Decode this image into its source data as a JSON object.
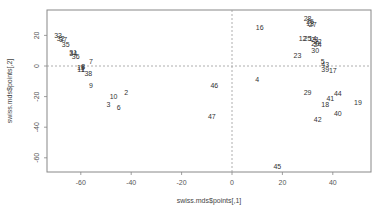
{
  "chart_data": {
    "type": "scatter",
    "title": "",
    "xlabel": "swiss.mds$points[,1]",
    "ylabel": "swiss.mds$points[,2]",
    "xlim": [
      -73,
      55
    ],
    "ylim": [
      -70,
      36
    ],
    "x_ticks": [
      -60,
      -40,
      -20,
      0,
      20,
      40
    ],
    "y_ticks": [
      20,
      0,
      -20,
      -40,
      -60
    ],
    "reference_lines": {
      "x": 0,
      "y": 0,
      "style": "dashed"
    },
    "grid": false,
    "legend": null,
    "marker": "text labels (point indices)",
    "points": [
      {
        "label": "33",
        "x": -69,
        "y": 20
      },
      {
        "label": "32",
        "x": -68,
        "y": 18
      },
      {
        "label": "37",
        "x": -67,
        "y": 17
      },
      {
        "label": "35",
        "x": -66,
        "y": 14
      },
      {
        "label": "31",
        "x": -63,
        "y": 9
      },
      {
        "label": "34",
        "x": -63,
        "y": 8
      },
      {
        "label": "36",
        "x": -62,
        "y": 6
      },
      {
        "label": "7",
        "x": -56,
        "y": 3
      },
      {
        "label": "8",
        "x": -59,
        "y": 0
      },
      {
        "label": "15",
        "x": -60,
        "y": -1
      },
      {
        "label": "1",
        "x": -59,
        "y": -2
      },
      {
        "label": "11",
        "x": -60,
        "y": -2
      },
      {
        "label": "38",
        "x": -57,
        "y": -5
      },
      {
        "label": "9",
        "x": -56,
        "y": -13
      },
      {
        "label": "10",
        "x": -47,
        "y": -20
      },
      {
        "label": "2",
        "x": -42,
        "y": -17
      },
      {
        "label": "3",
        "x": -49,
        "y": -25
      },
      {
        "label": "6",
        "x": -45,
        "y": -27
      },
      {
        "label": "46",
        "x": -7,
        "y": -13
      },
      {
        "label": "47",
        "x": -8,
        "y": -33
      },
      {
        "label": "16",
        "x": 11,
        "y": 25
      },
      {
        "label": "4",
        "x": 10,
        "y": -9
      },
      {
        "label": "45",
        "x": 18,
        "y": -66
      },
      {
        "label": "23",
        "x": 26,
        "y": 7
      },
      {
        "label": "28",
        "x": 30,
        "y": 31
      },
      {
        "label": "26",
        "x": 31,
        "y": 29
      },
      {
        "label": "13",
        "x": 31,
        "y": 28
      },
      {
        "label": "27",
        "x": 32,
        "y": 27
      },
      {
        "label": "12",
        "x": 28,
        "y": 18
      },
      {
        "label": "25",
        "x": 30,
        "y": 18
      },
      {
        "label": "14",
        "x": 32,
        "y": 18
      },
      {
        "label": "21",
        "x": 33,
        "y": 17
      },
      {
        "label": "22",
        "x": 34,
        "y": 16
      },
      {
        "label": "24",
        "x": 34,
        "y": 14
      },
      {
        "label": "20",
        "x": 33,
        "y": 15
      },
      {
        "label": "30",
        "x": 33,
        "y": 10
      },
      {
        "label": "5",
        "x": 36,
        "y": 3
      },
      {
        "label": "43",
        "x": 37,
        "y": 1
      },
      {
        "label": "39",
        "x": 37,
        "y": -2
      },
      {
        "label": "17",
        "x": 40,
        "y": -3
      },
      {
        "label": "29",
        "x": 30,
        "y": -17
      },
      {
        "label": "44",
        "x": 42,
        "y": -18
      },
      {
        "label": "41",
        "x": 39,
        "y": -21
      },
      {
        "label": "18",
        "x": 37,
        "y": -25
      },
      {
        "label": "19",
        "x": 50,
        "y": -24
      },
      {
        "label": "40",
        "x": 42,
        "y": -31
      },
      {
        "label": "42",
        "x": 34,
        "y": -35
      }
    ]
  },
  "plot_box": {
    "left": 47,
    "top": 10,
    "right": 371,
    "bottom": 172
  },
  "mapping": {
    "x0_px": 232,
    "px_per_x": 2.52,
    "y0_px": 66,
    "px_per_y": 1.53
  },
  "colors": {
    "axis": "#888888",
    "text": "#333333",
    "refline": "#999999",
    "background": "#ffffff"
  }
}
